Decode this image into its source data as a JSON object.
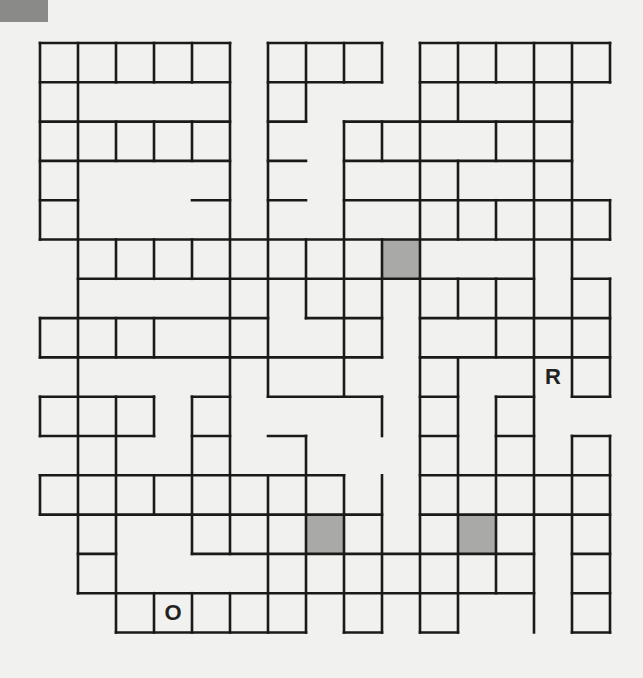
{
  "puzzle": {
    "grid": {
      "origin_x": 40,
      "origin_y": 43,
      "cell_w": 38,
      "cell_h": 39.3,
      "cols": 15,
      "rows": 15,
      "line_color": "#1a1a1a",
      "shade_color": "#a9a9a7"
    },
    "corner_block_color": "#8a8a88",
    "shaded_cells": [
      [
        9,
        5
      ],
      [
        7,
        12
      ],
      [
        11,
        12
      ]
    ],
    "letters": [
      {
        "char": "R",
        "col": 13,
        "row": 8
      },
      {
        "char": "O",
        "col": 3,
        "row": 14
      }
    ],
    "h_lines": {
      "0": [
        [
          0,
          5
        ],
        [
          6,
          9
        ],
        [
          10,
          15
        ]
      ],
      "1": [
        [
          0,
          5
        ],
        [
          6,
          9
        ],
        [
          10,
          15
        ]
      ],
      "2": [
        [
          0,
          5
        ],
        [
          6,
          7
        ],
        [
          8,
          14
        ]
      ],
      "3": [
        [
          0,
          5
        ],
        [
          6,
          7
        ],
        [
          8,
          14
        ]
      ],
      "4": [
        [
          0,
          1
        ],
        [
          4,
          5
        ],
        [
          6,
          7
        ],
        [
          8,
          15
        ]
      ],
      "5": [
        [
          0,
          15
        ]
      ],
      "6": [
        [
          1,
          13
        ],
        [
          14,
          15
        ]
      ],
      "7": [
        [
          0,
          6
        ],
        [
          7,
          9
        ],
        [
          10,
          15
        ]
      ],
      "8": [
        [
          0,
          9
        ],
        [
          10,
          15
        ]
      ],
      "9": [
        [
          0,
          3
        ],
        [
          4,
          5
        ],
        [
          6,
          9
        ],
        [
          10,
          11
        ],
        [
          12,
          13
        ],
        [
          14,
          15
        ]
      ],
      "10": [
        [
          0,
          3
        ],
        [
          4,
          5
        ],
        [
          6,
          7
        ],
        [
          10,
          11
        ],
        [
          12,
          13
        ],
        [
          14,
          15
        ]
      ],
      "11": [
        [
          0,
          8
        ],
        [
          10,
          15
        ]
      ],
      "12": [
        [
          0,
          9
        ],
        [
          10,
          15
        ]
      ],
      "13": [
        [
          1,
          2
        ],
        [
          4,
          13
        ],
        [
          14,
          15
        ]
      ],
      "14": [
        [
          1,
          13
        ],
        [
          14,
          15
        ]
      ],
      "15": [
        [
          2,
          7
        ],
        [
          8,
          9
        ],
        [
          10,
          11
        ],
        [
          14,
          15
        ]
      ]
    },
    "v_lines": {
      "0": [
        [
          0,
          5
        ],
        [
          7,
          8
        ],
        [
          9,
          10
        ],
        [
          11,
          12
        ]
      ],
      "1": [
        [
          0,
          14
        ]
      ],
      "2": [
        [
          0,
          1
        ],
        [
          2,
          3
        ],
        [
          5,
          6
        ],
        [
          7,
          8
        ],
        [
          9,
          15
        ]
      ],
      "3": [
        [
          0,
          1
        ],
        [
          2,
          3
        ],
        [
          5,
          6
        ],
        [
          7,
          8
        ],
        [
          9,
          10
        ],
        [
          11,
          12
        ],
        [
          14,
          15
        ]
      ],
      "4": [
        [
          0,
          1
        ],
        [
          2,
          3
        ],
        [
          5,
          6
        ],
        [
          9,
          13
        ],
        [
          14,
          15
        ]
      ],
      "5": [
        [
          0,
          13
        ],
        [
          14,
          15
        ]
      ],
      "6": [
        [
          0,
          9
        ],
        [
          11,
          15
        ]
      ],
      "7": [
        [
          0,
          2
        ],
        [
          5,
          7
        ],
        [
          10,
          15
        ]
      ],
      "8": [
        [
          0,
          1
        ],
        [
          2,
          9
        ],
        [
          11,
          15
        ]
      ],
      "9": [
        [
          0,
          1
        ],
        [
          2,
          3
        ],
        [
          5,
          8
        ],
        [
          9,
          10
        ],
        [
          11,
          15
        ]
      ],
      "10": [
        [
          0,
          15
        ]
      ],
      "11": [
        [
          0,
          2
        ],
        [
          3,
          5
        ],
        [
          6,
          7
        ],
        [
          8,
          15
        ]
      ],
      "12": [
        [
          0,
          1
        ],
        [
          2,
          3
        ],
        [
          4,
          5
        ],
        [
          6,
          8
        ],
        [
          9,
          14
        ]
      ],
      "13": [
        [
          0,
          15
        ]
      ],
      "14": [
        [
          0,
          9
        ],
        [
          10,
          15
        ]
      ],
      "15": [
        [
          0,
          1
        ],
        [
          4,
          5
        ],
        [
          6,
          9
        ],
        [
          10,
          15
        ]
      ]
    }
  }
}
